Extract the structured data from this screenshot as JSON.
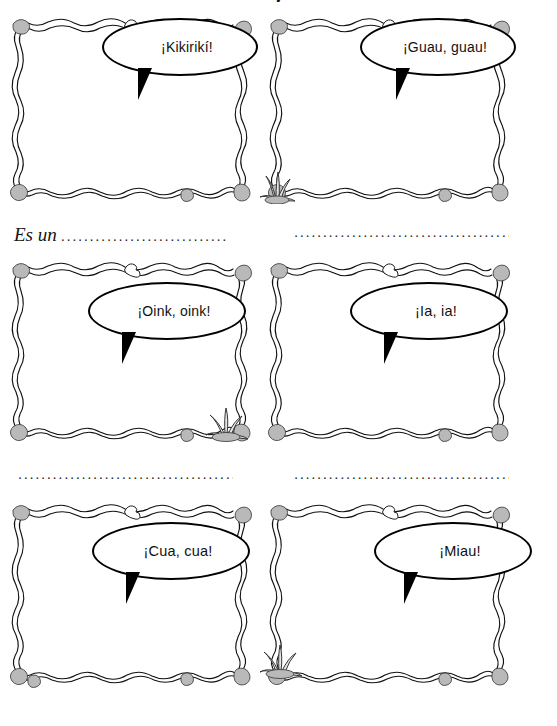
{
  "page": {
    "title_fragment": "y",
    "background_color": "#ffffff",
    "ink_color": "#000000",
    "frame_shade_color": "#b4b4b4",
    "columns": 2,
    "rows": 3
  },
  "panels": [
    {
      "id": "panel-1",
      "bubble_text": "¡Kikirikí!",
      "animal_hint": "rooster",
      "has_plant_decoration": false,
      "plant_position": ""
    },
    {
      "id": "panel-2",
      "bubble_text": "¡Guau, guau!",
      "animal_hint": "dog",
      "has_plant_decoration": true,
      "plant_position": "bottom-left"
    },
    {
      "id": "panel-3",
      "bubble_text": "¡Oink, oink!",
      "animal_hint": "pig",
      "has_plant_decoration": true,
      "plant_position": "bottom-right"
    },
    {
      "id": "panel-4",
      "bubble_text": "¡Ia, ia!",
      "animal_hint": "donkey",
      "has_plant_decoration": false,
      "plant_position": ""
    },
    {
      "id": "panel-5",
      "bubble_text": "¡Cua, cua!",
      "animal_hint": "duck",
      "has_plant_decoration": false,
      "plant_position": ""
    },
    {
      "id": "panel-6",
      "bubble_text": "¡Miau!",
      "animal_hint": "cat",
      "has_plant_decoration": true,
      "plant_position": "bottom-left"
    }
  ],
  "answer_lines": [
    {
      "id": "answer-1",
      "prompt": "Es un",
      "dots": "........................................"
    },
    {
      "id": "answer-2",
      "prompt": "",
      "dots": "................................................."
    },
    {
      "id": "answer-3",
      "prompt": "",
      "dots": "................................................."
    },
    {
      "id": "answer-4",
      "prompt": "",
      "dots": "................................................."
    }
  ]
}
